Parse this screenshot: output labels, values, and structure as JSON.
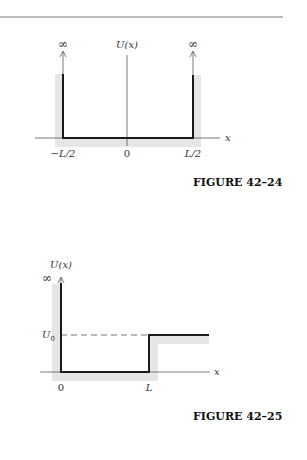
{
  "top_rule": {
    "visible": true
  },
  "figures": [
    {
      "caption": "FIGURE 42–24",
      "y_axis_label": "U(x)",
      "x_axis_label": "x",
      "tick_labels": [
        "−L/2",
        "0",
        "L/2"
      ],
      "left_infinity": "∞",
      "right_infinity": "∞",
      "description": "Infinite square well from −L/2 to L/2 with U = 0 inside"
    },
    {
      "caption": "FIGURE 42–25",
      "y_axis_label": "U(x)",
      "x_axis_label": "x",
      "tick_labels": [
        "0",
        "L"
      ],
      "infinity": "∞",
      "level_label": "U",
      "level_subscript": "0",
      "description": "Infinite wall at x = 0, U = 0 for 0 < x < L, step up to U0 for x > L"
    }
  ],
  "colors": {
    "shade": "#e6e6e6",
    "line": "#1a1a1a",
    "axis": "#555555",
    "rule": "#777777"
  }
}
